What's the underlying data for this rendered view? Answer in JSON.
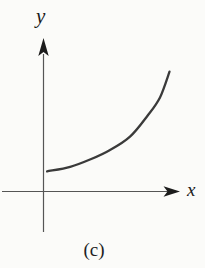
{
  "figure": {
    "y_axis_label": "y",
    "x_axis_label": "x",
    "caption": "(c)"
  },
  "colors": {
    "background": "#fbfbf9",
    "axis_line": "#555555",
    "arrowhead": "#1c1c1c",
    "curve": "#3a3a3a",
    "text": "#1a1a1a"
  },
  "chart_data": {
    "type": "line",
    "title": "",
    "xlabel": "x",
    "ylabel": "y",
    "caption": "(c)",
    "grid": false,
    "legend": "none",
    "ticks": "none",
    "axis_ranges": {
      "x": [
        0,
        1
      ],
      "y": [
        0,
        1
      ]
    },
    "series": [
      {
        "name": "curve",
        "x": [
          0.03,
          0.2,
          0.35,
          0.49,
          0.64,
          0.77,
          0.86,
          0.93
        ],
        "y": [
          0.13,
          0.16,
          0.21,
          0.27,
          0.36,
          0.5,
          0.62,
          0.79
        ]
      }
    ]
  }
}
